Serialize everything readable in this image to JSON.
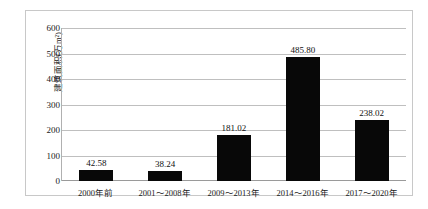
{
  "chart_data": {
    "type": "bar",
    "title": "",
    "xlabel": "",
    "ylabel": "建筑面积(万m²)",
    "categories": [
      "2000年前",
      "2001～2008年",
      "2009～2013年",
      "2014～2016年",
      "2017～2020年"
    ],
    "values": [
      42.58,
      38.24,
      181.02,
      485.8,
      238.02
    ],
    "value_labels": [
      "42.58",
      "38.24",
      "181.02",
      "485.80",
      "238.02"
    ],
    "ylim": [
      0,
      600
    ],
    "ytick_labels": [
      "0",
      "100",
      "200",
      "300",
      "400",
      "500",
      "600"
    ],
    "ytick_values": [
      0,
      100,
      200,
      300,
      400,
      500,
      600
    ],
    "grid": "horizontal",
    "legend": "none",
    "bar_color": "#080808",
    "gridline_color": "#bfbfbf",
    "background_color": "#ffffff",
    "border_color": "#c8c8c8"
  }
}
